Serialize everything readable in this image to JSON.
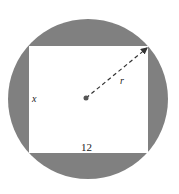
{
  "diagram": {
    "colors": {
      "circle_fill": "#808080",
      "rectangle_fill": "#ffffff",
      "radius_line": "#333333"
    },
    "labels": {
      "side_left": "x",
      "side_bottom": "12",
      "radius": "r"
    }
  }
}
